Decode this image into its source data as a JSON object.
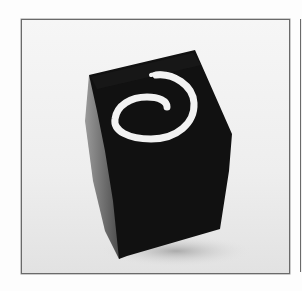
{
  "image": {
    "subject": "black cube with white spiral",
    "background_color": "#ececec",
    "frame_color": "#6a6a6a",
    "cube_face_color": "#111111",
    "cube_side_color": "#6e6e6e",
    "spiral_color": "#f2f2f2"
  },
  "caption": ""
}
